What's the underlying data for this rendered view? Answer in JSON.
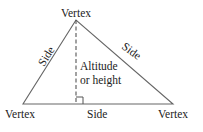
{
  "diagram": {
    "labels": {
      "top_vertex": "Vertex",
      "left_vertex": "Vertex",
      "right_vertex": "Vertex",
      "left_side": "Side",
      "right_side": "Side",
      "bottom_side": "Side",
      "altitude_line1": "Altitude",
      "altitude_line2": "or height"
    },
    "colors": {
      "stroke": "#555555",
      "text": "#222222"
    }
  }
}
